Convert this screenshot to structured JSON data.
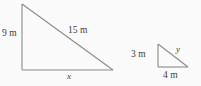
{
  "figure": {
    "background_color": "#fbfbfb",
    "stroke_color": "#8a8a8a",
    "text_color": "#3b3b3b"
  },
  "large_triangle": {
    "name": "large-right-triangle",
    "vertices": {
      "top_left": [
        22,
        4
      ],
      "bottom_left": [
        22,
        70
      ],
      "bottom_right": [
        113,
        70
      ]
    },
    "labels": {
      "vertical_leg": "9 m",
      "hypotenuse": "15 m",
      "base": "x"
    }
  },
  "small_triangle": {
    "name": "small-right-triangle",
    "vertices": {
      "top_left": [
        158,
        44
      ],
      "bottom_left": [
        158,
        67
      ],
      "bottom_right": [
        188,
        67
      ]
    },
    "labels": {
      "vertical_leg": "3 m",
      "hypotenuse": "y",
      "base": "4 m"
    }
  }
}
